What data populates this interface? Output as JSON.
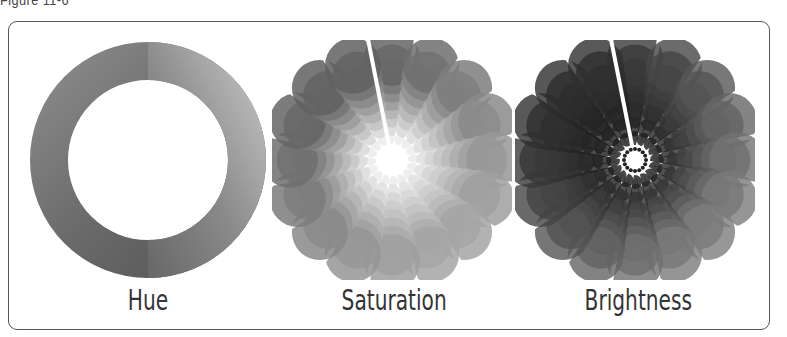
{
  "figure": {
    "caption": "Figure 11-6",
    "panels": [
      {
        "id": "hue",
        "label": "Hue"
      },
      {
        "id": "saturation",
        "label": "Saturation"
      },
      {
        "id": "brightness",
        "label": "Brightness"
      }
    ]
  },
  "colors": {
    "frame": "#555555",
    "text": "#333333"
  }
}
